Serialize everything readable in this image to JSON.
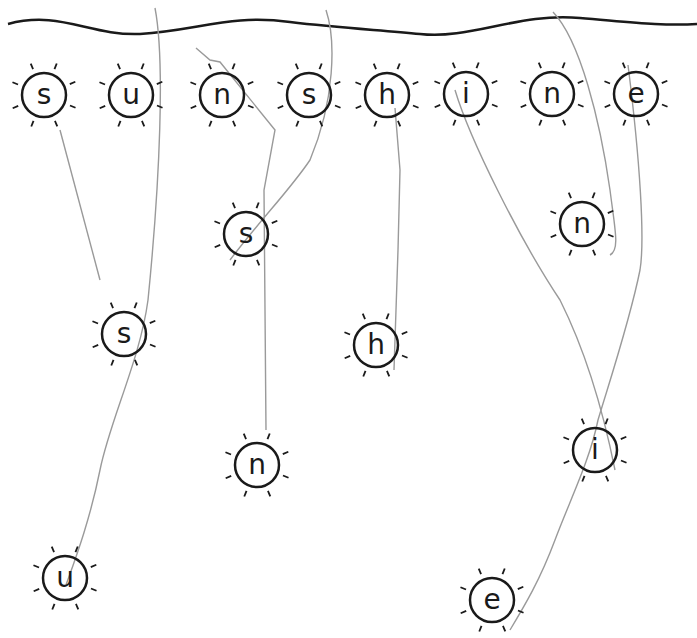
{
  "word": "sunshine",
  "colors": {
    "ink": "#1a1a1a",
    "trace": "#9a9a9a"
  },
  "top_row": [
    {
      "letter": "s",
      "x": 44,
      "y": 95
    },
    {
      "letter": "u",
      "x": 131,
      "y": 95
    },
    {
      "letter": "n",
      "x": 222,
      "y": 95
    },
    {
      "letter": "s",
      "x": 309,
      "y": 95
    },
    {
      "letter": "h",
      "x": 387,
      "y": 95
    },
    {
      "letter": "i",
      "x": 466,
      "y": 94
    },
    {
      "letter": "n",
      "x": 552,
      "y": 94
    },
    {
      "letter": "e",
      "x": 636,
      "y": 94
    }
  ],
  "scattered": [
    {
      "letter": "s",
      "x": 246,
      "y": 234
    },
    {
      "letter": "n",
      "x": 582,
      "y": 224
    },
    {
      "letter": "s",
      "x": 124,
      "y": 334
    },
    {
      "letter": "h",
      "x": 376,
      "y": 345
    },
    {
      "letter": "i",
      "x": 595,
      "y": 450
    },
    {
      "letter": "n",
      "x": 257,
      "y": 465
    },
    {
      "letter": "u",
      "x": 65,
      "y": 578
    },
    {
      "letter": "e",
      "x": 492,
      "y": 600
    }
  ]
}
